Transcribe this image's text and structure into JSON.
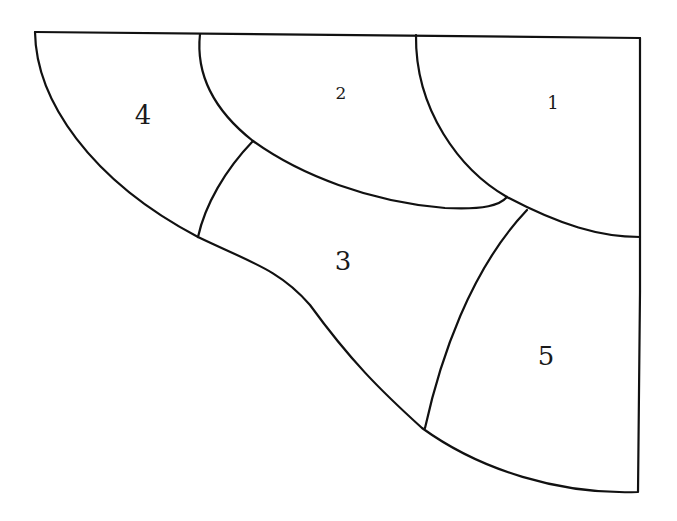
{
  "diagram": {
    "type": "region-partition",
    "stroke_color": "#111111",
    "background": "#ffffff",
    "regions": [
      {
        "id": "1",
        "label": "1",
        "x": 553,
        "y": 103,
        "size": 18
      },
      {
        "id": "2",
        "label": "2",
        "x": 341,
        "y": 93,
        "size": 17
      },
      {
        "id": "3",
        "label": "3",
        "x": 343,
        "y": 261,
        "size": 26
      },
      {
        "id": "4",
        "label": "4",
        "x": 143,
        "y": 115,
        "size": 26
      },
      {
        "id": "5",
        "label": "5",
        "x": 546,
        "y": 356,
        "size": 26
      }
    ]
  }
}
